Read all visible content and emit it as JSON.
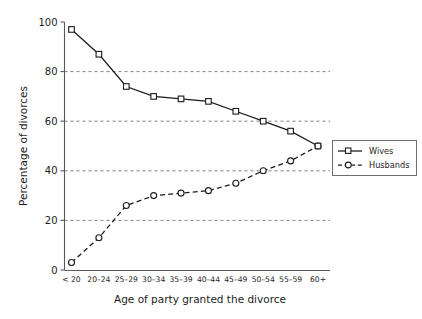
{
  "chart_data": {
    "type": "line",
    "title": "",
    "xlabel": "Age of party granted the divorce",
    "ylabel": "Percentage of divorces",
    "categories": [
      "< 20",
      "20–24",
      "25–29",
      "30–34",
      "35–39",
      "40–44",
      "45–49",
      "50–54",
      "55–59",
      "60+"
    ],
    "ylim": [
      0,
      100
    ],
    "yticks": [
      0,
      20,
      40,
      60,
      80,
      100
    ],
    "ytick_labels": [
      "0",
      "20",
      "40",
      "60",
      "80",
      "100"
    ],
    "grid": "horizontal-dashed",
    "legend_position": "right",
    "series": [
      {
        "name": "Wives",
        "marker": "square",
        "line_style": "solid",
        "color": "#1b1b1b",
        "values": [
          97,
          87,
          74,
          70,
          69,
          68,
          64,
          60,
          56,
          50
        ]
      },
      {
        "name": "Husbands",
        "marker": "circle",
        "line_style": "dashed",
        "color": "#1b1b1b",
        "values": [
          3,
          13,
          26,
          30,
          31,
          32,
          35,
          40,
          44,
          50
        ]
      }
    ]
  },
  "axes": {
    "y_axis_title": "Percentage of divorces",
    "x_axis_title": "Age of party granted the divorce"
  },
  "legend": {
    "entries": [
      {
        "label": "Wives"
      },
      {
        "label": "Husbands"
      }
    ]
  }
}
